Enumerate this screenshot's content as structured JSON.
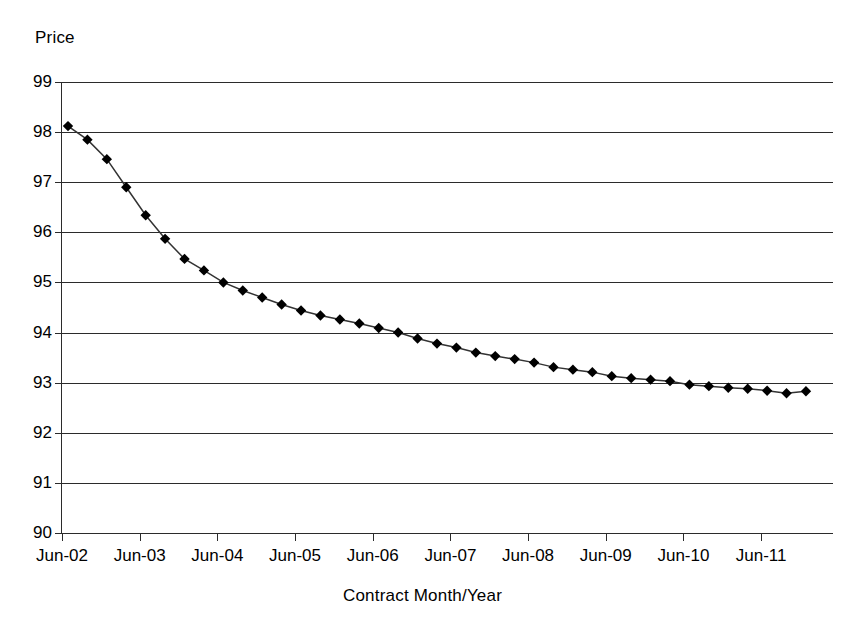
{
  "chart_data": {
    "type": "line",
    "title": "",
    "subtitle": "",
    "xlabel": "Contract Month/Year",
    "ylabel": "Price",
    "ylim": [
      90,
      99
    ],
    "y_ticks": [
      99,
      98,
      97,
      96,
      95,
      94,
      93,
      92,
      91,
      90
    ],
    "x_tick_labels": [
      "Jun-02",
      "Jun-03",
      "Jun-04",
      "Jun-05",
      "Jun-06",
      "Jun-07",
      "Jun-08",
      "Jun-09",
      "Jun-10",
      "Jun-11"
    ],
    "grid": true,
    "legend": null,
    "marker": "diamond",
    "marker_color": "#000000",
    "line_color": "#333333",
    "series": [
      {
        "name": "Price",
        "x": [
          "Jun-02",
          "Sep-02",
          "Dec-02",
          "Mar-03",
          "Jun-03",
          "Sep-03",
          "Dec-03",
          "Mar-04",
          "Jun-04",
          "Sep-04",
          "Dec-04",
          "Mar-05",
          "Jun-05",
          "Sep-05",
          "Dec-05",
          "Mar-06",
          "Jun-06",
          "Sep-06",
          "Dec-06",
          "Mar-07",
          "Jun-07",
          "Sep-07",
          "Dec-07",
          "Mar-08",
          "Jun-08",
          "Sep-08",
          "Dec-08",
          "Mar-09",
          "Jun-09",
          "Sep-09",
          "Dec-09",
          "Mar-10",
          "Jun-10",
          "Sep-10",
          "Dec-10",
          "Mar-11",
          "Jun-11",
          "Sep-11",
          "Dec-11"
        ],
        "values": [
          98.12,
          97.85,
          97.46,
          96.9,
          96.34,
          95.87,
          95.47,
          95.24,
          95.0,
          94.84,
          94.7,
          94.56,
          94.44,
          94.34,
          94.26,
          94.18,
          94.09,
          94.0,
          93.88,
          93.78,
          93.7,
          93.6,
          93.53,
          93.47,
          93.4,
          93.31,
          93.26,
          93.21,
          93.13,
          93.09,
          93.06,
          93.03,
          92.96,
          92.93,
          92.9,
          92.88,
          92.84,
          92.79,
          92.83
        ]
      }
    ]
  },
  "axes": {
    "y_title": "Price",
    "x_title": "Contract Month/Year"
  }
}
